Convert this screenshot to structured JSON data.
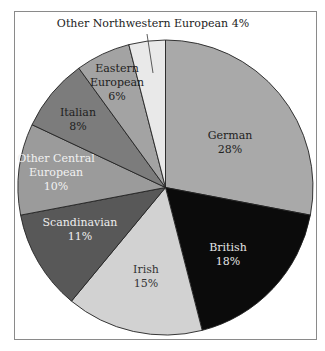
{
  "chart_data": {
    "type": "pie",
    "title": "",
    "start_angle_deg": 0,
    "direction": "clockwise",
    "slices": [
      {
        "label": "German",
        "value": 28,
        "pct_label": "28%",
        "color": "#a9a9a9",
        "text_color": "#222222"
      },
      {
        "label": "British",
        "value": 18,
        "pct_label": "18%",
        "color": "#0b0b0b",
        "text_color": "#e6e6e6"
      },
      {
        "label": "Irish",
        "value": 15,
        "pct_label": "15%",
        "color": "#d2d2d2",
        "text_color": "#333333"
      },
      {
        "label": "Scandinavian",
        "value": 11,
        "pct_label": "11%",
        "color": "#585858",
        "text_color": "#eeeeee"
      },
      {
        "label": "Other Central European",
        "value": 10,
        "pct_label": "10%",
        "color": "#9b9b9b",
        "text_color": "#f2f2f2"
      },
      {
        "label": "Italian",
        "value": 8,
        "pct_label": "8%",
        "color": "#7c7c7c",
        "text_color": "#1e1e1e"
      },
      {
        "label": "Eastern European",
        "value": 6,
        "pct_label": "6%",
        "color": "#a3a3a3",
        "text_color": "#1e1e1e"
      },
      {
        "label": "Other Northwestern European",
        "value": 4,
        "pct_label": "4%",
        "color": "#e9e9e9",
        "text_color": "#222222"
      }
    ],
    "callout": {
      "text": "Other Northwestern European 4%",
      "target": "Other Northwestern European"
    },
    "legend": "none"
  }
}
